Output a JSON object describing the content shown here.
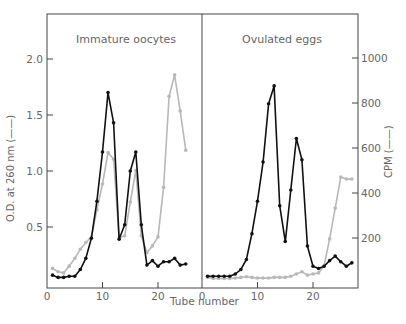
{
  "chart_data": {
    "type": "line",
    "xlabel": "Tube number",
    "ylabel_left": "O.D. at 260 nm (——)",
    "ylabel_right": "CPM (——)",
    "left_axis": {
      "ticks": [
        0.5,
        1.0,
        1.5,
        2.0
      ],
      "tick_labels": [
        "0.5",
        "1.0",
        "1.5",
        "2.0"
      ],
      "range": [
        0,
        2.4
      ]
    },
    "right_axis": {
      "ticks": [
        200,
        400,
        600,
        800,
        1000
      ],
      "tick_labels": [
        "200",
        "400",
        "600",
        "800",
        "1000"
      ],
      "range": [
        0,
        1200
      ]
    },
    "x_axis": {
      "ticks": [
        0,
        10,
        20
      ],
      "tick_labels": [
        "0",
        "10",
        "20"
      ]
    },
    "grid": false,
    "colors": {
      "od": "#111111",
      "cpm": "#b8b8b8"
    },
    "panels": [
      {
        "title": "Immature oocytes",
        "x": [
          1,
          2,
          3,
          4,
          5,
          6,
          7,
          8,
          9,
          10,
          11,
          12,
          13,
          14,
          15,
          16,
          17,
          18,
          19,
          20,
          21,
          22,
          23,
          24,
          25
        ],
        "series": [
          {
            "name": "O.D. at 260 nm",
            "axis": "left",
            "values": [
              0.07,
              0.05,
              0.05,
              0.06,
              0.06,
              0.12,
              0.22,
              0.4,
              0.73,
              1.17,
              1.7,
              1.43,
              0.39,
              0.52,
              1.0,
              1.17,
              0.52,
              0.16,
              0.2,
              0.15,
              0.19,
              0.19,
              0.22,
              0.16,
              0.17
            ]
          },
          {
            "name": "CPM",
            "axis": "right",
            "values": [
              65,
              50,
              45,
              75,
              110,
              150,
              180,
              205,
              325,
              440,
              580,
              550,
              200,
              210,
              360,
              500,
              210,
              135,
              165,
              205,
              425,
              830,
              925,
              765,
              590
            ]
          }
        ]
      },
      {
        "title": "Ovulated eggs",
        "x": [
          1,
          2,
          3,
          4,
          5,
          6,
          7,
          8,
          9,
          10,
          11,
          12,
          13,
          14,
          15,
          16,
          17,
          18,
          19,
          20,
          21,
          22,
          23,
          24,
          25,
          26,
          27
        ],
        "series": [
          {
            "name": "O.D. at 260 nm",
            "axis": "left",
            "values": [
              0.06,
              0.06,
              0.06,
              0.06,
              0.06,
              0.08,
              0.12,
              0.21,
              0.44,
              0.73,
              1.08,
              1.6,
              1.76,
              0.69,
              0.37,
              0.83,
              1.29,
              1.1,
              0.33,
              0.15,
              0.13,
              0.15,
              0.2,
              0.24,
              0.19,
              0.15,
              0.18
            ]
          },
          {
            "name": "CPM",
            "axis": "right",
            "values": [
              25,
              20,
              20,
              20,
              20,
              22,
              25,
              28,
              25,
              22,
              22,
              22,
              25,
              25,
              25,
              30,
              40,
              50,
              35,
              40,
              45,
              76,
              196,
              333,
              471,
              462,
              462
            ]
          }
        ]
      }
    ]
  }
}
